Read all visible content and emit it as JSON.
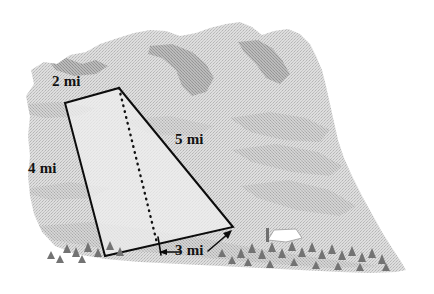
{
  "figure": {
    "kind": "geometry-diagram",
    "background_color": "#ffffff",
    "scene": {
      "name": "mountain-hillside-illustration",
      "style": "grayscale halftone line art",
      "colors": {
        "hill_light": "#d7d7d7",
        "hill_mid": "#c2c2c2",
        "hill_shadow": "#a8a8a8",
        "ridge_dark": "#8d8d8d",
        "tree": "#7d7d7d",
        "tree_dark": "#6a6a6a",
        "building": "#ffffff",
        "outline": "#000000",
        "parcel_fill": "#efefef",
        "dotted_line": "#111111"
      },
      "elements": [
        "mountain-silhouette",
        "ridge-shading",
        "tree-line",
        "white-building"
      ]
    },
    "parcel": {
      "name": "quadrilateral-plot",
      "shape": "trapezoid",
      "fill": "#efefef",
      "stroke": "#000000",
      "stroke_width": 2,
      "vertices": [
        {
          "name": "top-left",
          "x": 65,
          "y": 103
        },
        {
          "name": "top-right",
          "x": 119,
          "y": 88
        },
        {
          "name": "bottom-right",
          "x": 233,
          "y": 227
        },
        {
          "name": "bottom-left",
          "x": 105,
          "y": 256
        }
      ],
      "interior_line": {
        "name": "height-dotted-line",
        "style": "dotted",
        "from": {
          "x": 119,
          "y": 88
        },
        "to": {
          "x": 157,
          "y": 243
        }
      }
    },
    "labels": {
      "top": "2 mi",
      "left": "4 mi",
      "right": "5 mi",
      "bottom": "3 mi"
    },
    "dimension_line": {
      "name": "bottom-dimension-3mi",
      "label": "3 mi",
      "left_tick": {
        "x": 158,
        "y": 239,
        "height": 16
      },
      "left_arrow": {
        "from": {
          "x": 178,
          "y": 252
        },
        "to": {
          "x": 160,
          "y": 252
        }
      },
      "right_arrow": {
        "from": {
          "x": 208,
          "y": 252
        },
        "to": {
          "x": 232,
          "y": 231
        }
      }
    },
    "measurements": [
      {
        "side": "top",
        "value": 2,
        "unit": "mi",
        "label": "2 mi"
      },
      {
        "side": "left",
        "value": 4,
        "unit": "mi",
        "label": "4 mi"
      },
      {
        "side": "right",
        "value": 5,
        "unit": "mi",
        "label": "5 mi"
      },
      {
        "side": "bottom",
        "value": 3,
        "unit": "mi",
        "label": "3 mi"
      }
    ]
  }
}
